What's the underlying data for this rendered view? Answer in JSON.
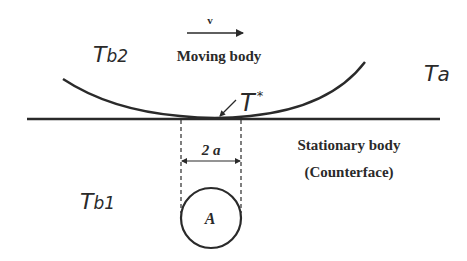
{
  "diagram": {
    "labels": {
      "velocity": "v",
      "moving_body": "Moving body",
      "stationary_body_line1": "Stationary body",
      "stationary_body_line2": "(Counterface)",
      "contact_width": "2 a",
      "circle_label": "A",
      "temp_moving_body": {
        "base": "T",
        "sub": "b2"
      },
      "temp_ambient": {
        "base": "T",
        "sub": "a"
      },
      "temp_flash": {
        "base": "T",
        "sup": "*"
      },
      "temp_stationary_body": {
        "base": "T",
        "sub": "b1"
      }
    },
    "colors": {
      "stroke": "#2a2a2a",
      "background": "#ffffff"
    }
  }
}
